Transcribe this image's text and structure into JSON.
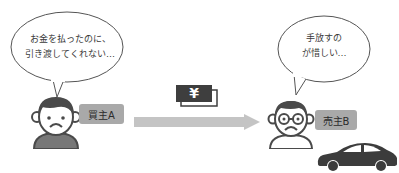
{
  "buyer": {
    "speech_line1": "お金を払ったのに、",
    "speech_line2": "引き渡してくれない…",
    "label": "買主A"
  },
  "seller": {
    "speech_line1": "手放すの",
    "speech_line2": "が惜しい…",
    "label": "売主B"
  },
  "transfer": {
    "money_symbol": "¥",
    "direction": "buyer-to-seller"
  },
  "colors": {
    "figure_dark": "#4a4a4a",
    "label_bg": "#a9a9a9",
    "arrow": "#c4c4c4",
    "car": "#3c3c3c"
  }
}
